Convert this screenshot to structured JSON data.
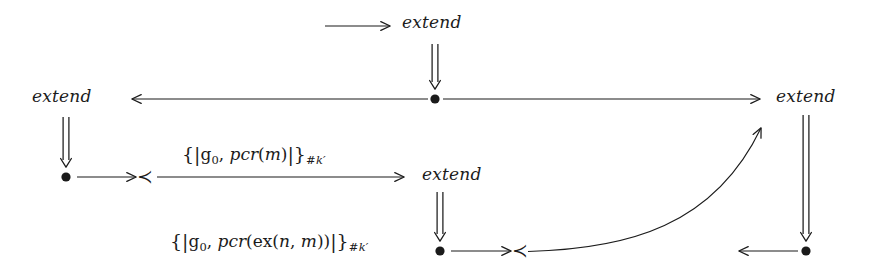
{
  "figure": {
    "kind": "strand-space-protocol-diagram",
    "background_color": "#ffffff",
    "ink_color": "#1b1b1b",
    "width": 874,
    "height": 280
  },
  "labels": {
    "extend_top": "extend",
    "extend_left": "extend",
    "extend_right": "extend",
    "extend_middle": "extend"
  },
  "terms": {
    "msg_pcr_m": {
      "open_brace": "{|",
      "base": "g",
      "base_sub": "0",
      "comma": ", ",
      "fn": "pcr",
      "open_paren": "(",
      "arg": "m",
      "close_paren": ")",
      "close_brace": "|}",
      "key_hash": "#",
      "key": "k",
      "key_prime": "′",
      "plain": "{| g0, pcr(m) |}#k'"
    },
    "msg_pcr_ex_n_m": {
      "open_brace": "{|",
      "base": "g",
      "base_sub": "0",
      "comma": ", ",
      "fn": "pcr",
      "open_paren": "(",
      "inner_fn": "ex",
      "inner_open": "(",
      "inner_arg1": "n",
      "inner_comma": ", ",
      "inner_arg2": "m",
      "inner_close": ")",
      "close_paren": ")",
      "close_brace": "|}",
      "key_hash": "#",
      "key": "k",
      "key_prime": "′",
      "plain": "{| g0, pcr(ex(n,m)) |}#k'"
    }
  },
  "symbols": {
    "precedes": "≺",
    "node_dot": "•"
  },
  "nodes": [
    {
      "id": "node-center",
      "x": 435,
      "y": 99,
      "r": 4.6
    },
    {
      "id": "node-left-lower",
      "x": 66,
      "y": 177,
      "r": 4.6
    },
    {
      "id": "node-middle-low",
      "x": 440,
      "y": 251,
      "r": 4.6
    },
    {
      "id": "node-right-low",
      "x": 806,
      "y": 251,
      "r": 4.6
    }
  ],
  "prec_marks": [
    {
      "id": "prec-left",
      "x": 143,
      "y": 177
    },
    {
      "id": "prec-middle",
      "x": 518,
      "y": 251
    }
  ],
  "arrows": [
    {
      "id": "arrow-top-incoming",
      "type": "single",
      "direction": "right",
      "x1": 325,
      "y1": 26,
      "x2": 396,
      "y2": 26
    },
    {
      "id": "arrow-top-down-double",
      "type": "double",
      "direction": "down",
      "x1": 435,
      "y1": 44,
      "x2": 435,
      "y2": 88
    },
    {
      "id": "arrow-center-to-left",
      "type": "single",
      "direction": "left",
      "x1": 428,
      "y1": 99,
      "x2": 126,
      "y2": 99
    },
    {
      "id": "arrow-center-to-right",
      "type": "single",
      "direction": "right",
      "x1": 443,
      "y1": 99,
      "x2": 766,
      "y2": 99
    },
    {
      "id": "arrow-left-down-double",
      "type": "double",
      "direction": "down",
      "x1": 66,
      "y1": 117,
      "x2": 66,
      "y2": 166
    },
    {
      "id": "arrow-left-node-to-prec",
      "type": "single",
      "direction": "right",
      "x1": 76,
      "y1": 177,
      "x2": 133,
      "y2": 177
    },
    {
      "id": "arrow-msg-m-to-extend",
      "type": "single",
      "direction": "right",
      "x1": 157,
      "y1": 177,
      "x2": 410,
      "y2": 177
    },
    {
      "id": "arrow-middle-down-double",
      "type": "double",
      "direction": "down",
      "x1": 440,
      "y1": 192,
      "x2": 440,
      "y2": 241
    },
    {
      "id": "arrow-mid-node-to-prec",
      "type": "single",
      "direction": "right",
      "x1": 450,
      "y1": 251,
      "x2": 508,
      "y2": 251
    },
    {
      "id": "arrow-right-down-double",
      "type": "double",
      "direction": "down",
      "x1": 806,
      "y1": 117,
      "x2": 806,
      "y2": 241
    },
    {
      "id": "arrow-right-node-to-left",
      "type": "single",
      "direction": "left",
      "x1": 798,
      "y1": 251,
      "x2": 733,
      "y2": 251
    }
  ],
  "curves": [
    {
      "id": "curve-prec-to-extend-right",
      "from_x": 528,
      "from_y": 251,
      "ctrl_x": 706,
      "ctrl_y": 249,
      "to_x": 766,
      "to_y": 122,
      "direction": "up-right"
    }
  ],
  "text_positions": {
    "extend_top": {
      "x": 402,
      "y": 17
    },
    "extend_left": {
      "x": 32,
      "y": 90
    },
    "extend_right": {
      "x": 776,
      "y": 90
    },
    "extend_middle": {
      "x": 422,
      "y": 168
    },
    "msg_pcr_m": {
      "x": 182,
      "y": 146
    },
    "msg_pcr_ex": {
      "x": 170,
      "y": 233
    }
  }
}
